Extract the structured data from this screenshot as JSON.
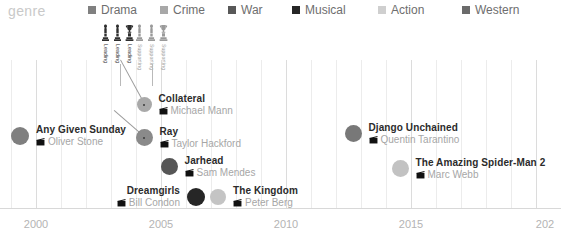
{
  "legend": {
    "title": "genre",
    "items": [
      {
        "label": "Drama",
        "color": "#808080",
        "x": 88,
        "icon": "legend-swatch"
      },
      {
        "label": "Crime",
        "color": "#a8a8a8",
        "x": 160,
        "icon": "legend-swatch"
      },
      {
        "label": "War",
        "color": "#585858",
        "x": 228,
        "icon": "legend-swatch"
      },
      {
        "label": "Musical",
        "color": "#262626",
        "x": 292,
        "icon": "legend-swatch"
      },
      {
        "label": "Action",
        "color": "#cfcfcf",
        "x": 378,
        "icon": "legend-swatch"
      },
      {
        "label": "Western",
        "color": "#6b6b6b",
        "x": 462,
        "icon": "legend-swatch"
      }
    ]
  },
  "axis": {
    "ticks": [
      {
        "label": "2000",
        "x": 36
      },
      {
        "label": "2005",
        "x": 161
      },
      {
        "label": "2010",
        "x": 286
      },
      {
        "label": "2015",
        "x": 411
      },
      {
        "label": "202",
        "x": 545
      }
    ],
    "gridlines_major_x": [
      36,
      161,
      286,
      411,
      536
    ],
    "gridlines_minor_x": [
      11,
      61,
      86,
      111,
      136,
      186,
      211,
      236,
      261,
      311,
      336,
      361,
      386,
      436,
      461,
      486,
      511
    ],
    "pixels_per_year": 25,
    "year_range": [
      1999,
      2020
    ]
  },
  "awards": {
    "groups": [
      {
        "x": 99,
        "stem_x": 120,
        "columns": [
          {
            "label": "Leading",
            "color": "#2e2e2e",
            "statue": "oscar-statuette"
          },
          {
            "label": "Leading",
            "color": "#2e2e2e",
            "statue": "oscar-statuette"
          },
          {
            "label": "Leading",
            "color": "#2e2e2e",
            "statue": "oscar-trophy"
          }
        ]
      },
      {
        "x": 133,
        "stem_x": 152,
        "columns": [
          {
            "label": "Supporting",
            "color": "#9a9a9a",
            "statue": "oscar-statuette"
          },
          {
            "label": "Supporting",
            "color": "#9a9a9a",
            "statue": "oscar-statuette"
          },
          {
            "label": "Supporting",
            "color": "#9a9a9a",
            "statue": "oscar-trophy"
          }
        ]
      }
    ]
  },
  "chart_data": {
    "type": "scatter",
    "title": "",
    "xlabel": "",
    "ylabel": "",
    "legend_position": "top",
    "grid": true,
    "xlim": [
      1999,
      2020
    ],
    "points": [
      {
        "title": "Any Given Sunday",
        "director": "Oliver Stone",
        "year": 1999,
        "genre": "Drama",
        "color": "#7f7f7f",
        "x": 20,
        "y": 135,
        "r": 9,
        "side": "right",
        "center_dot": false
      },
      {
        "title": "Collateral",
        "director": "Michael Mann",
        "year": 2004,
        "genre": "Crime",
        "color": "#a9a9a9",
        "x": 144,
        "y": 104,
        "r": 7.5,
        "side": "right",
        "center_dot": true
      },
      {
        "title": "Ray",
        "director": "Taylor Hackford",
        "year": 2004,
        "genre": "Drama",
        "color": "#8a8a8a",
        "x": 144,
        "y": 137,
        "r": 8.5,
        "side": "right",
        "center_dot": true
      },
      {
        "title": "Jarhead",
        "director": "Sam Mendes",
        "year": 2005,
        "genre": "War",
        "color": "#565656",
        "x": 169,
        "y": 166,
        "r": 8.5,
        "side": "right",
        "center_dot": false
      },
      {
        "title": "Dreamgirls",
        "director": "Bill Condon",
        "year": 2006,
        "genre": "Musical",
        "color": "#262626",
        "x": 196,
        "y": 196,
        "r": 9,
        "side": "left",
        "center_dot": false
      },
      {
        "title": "The Kingdom",
        "director": "Peter Berg",
        "year": 2007,
        "genre": "Action",
        "color": "#c4c4c4",
        "x": 218,
        "y": 196,
        "r": 8,
        "side": "right",
        "center_dot": false
      },
      {
        "title": "Django Unchained",
        "director": "Quentin Tarantino",
        "year": 2012,
        "genre": "Western",
        "color": "#787878",
        "x": 353,
        "y": 133,
        "r": 8.5,
        "side": "right",
        "center_dot": false
      },
      {
        "title": "The Amazing Spider-Man 2",
        "director": "Marc Webb",
        "year": 2014,
        "genre": "Action",
        "color": "#c2c2c2",
        "x": 400,
        "y": 168,
        "r": 8.5,
        "side": "right",
        "center_dot": false
      }
    ],
    "connectors": [
      {
        "x1": 144,
        "y1": 104,
        "x2": 120,
        "y2": 60
      },
      {
        "x1": 144,
        "y1": 137,
        "x2": 114,
        "y2": 111
      }
    ]
  }
}
